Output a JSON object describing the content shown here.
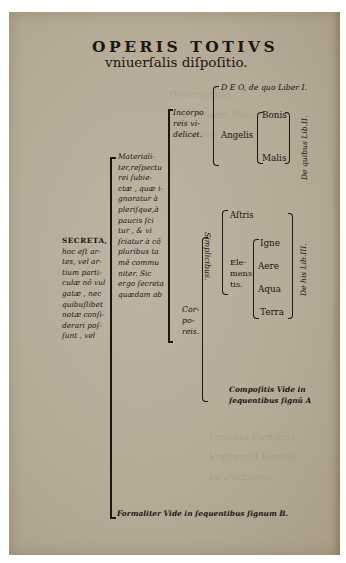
{
  "page": {
    "paper_color": "#b5ab97",
    "ink_color": "#1c1712",
    "title": {
      "line1": "OPERIS TOTIVS",
      "line2": "vniuerſalis diſpoſitio."
    },
    "root": {
      "label_lines": [
        "SECRETA,",
        "hoc eſt ar-",
        "tes, vel ar-",
        "tium parti-",
        "culæ nõ vul",
        "gatæ , nec",
        "quibuſlibet",
        "notæ conſi-",
        "derari poſ-",
        "ſunt , vel"
      ]
    },
    "materialiter": {
      "label_lines": [
        "Materiali-",
        "ter,reſpectu",
        "rei ſubie-",
        "ctæ , quæ i-",
        "gnoratur à",
        "pleriſque,à",
        "paucis ſci",
        "tur , & vi",
        "ſciatur à cõ",
        "pluribus ta",
        "mẽ commu",
        "niter. Sic",
        "ergo ſecreta",
        "quædam ab"
      ]
    },
    "incorporeis": {
      "label_lines": [
        "Incorpo",
        "reis vi-",
        "delicet."
      ],
      "deo": "D E O, de quo Liber I.",
      "angelis": "Angelis",
      "angel_kinds": [
        "Bonis",
        "Malis"
      ],
      "side_note": "De quibus Lib.II."
    },
    "corporeis": {
      "label_lines": [
        "Cor-",
        "po-",
        "reis."
      ],
      "simplicibus": "Simplicibus.",
      "astris": "Aſtris",
      "elementis_lines": [
        "Ele-",
        "mens",
        "tis."
      ],
      "elements": [
        "Igne",
        "Aere",
        "Aqua",
        "Terra"
      ],
      "side_note": "De his Lib.III.",
      "compositis_lines": [
        "Compoſitis Vide in",
        "ſequentibus ſignũ A"
      ]
    },
    "formaliter": "Formaliter Vide in ſequentibus ſignum B."
  }
}
